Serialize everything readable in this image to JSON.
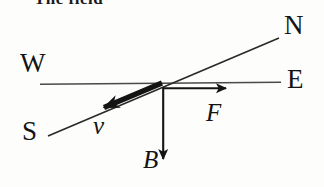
{
  "figure": {
    "kind": "physics-vector-diagram",
    "clipped_header_text": "The field",
    "background_color": "#fdfdfc",
    "ink_color": "#141414",
    "axis_line_color": "#4a4a48"
  },
  "compass": {
    "west_label": "W",
    "north_label": "N",
    "east_label": "E",
    "south_label": "S"
  },
  "vectors": {
    "velocity_label": "v",
    "force_label": "F",
    "field_label": "B"
  },
  "geometry": {
    "origin": {
      "x": 163,
      "y": 83
    },
    "we_axis": {
      "x1": 40,
      "y1": 84,
      "x2": 281,
      "y2": 82
    },
    "sn_axis": {
      "x1": 48,
      "y1": 136,
      "x2": 279,
      "y2": 38
    },
    "velocity_arrow": {
      "x1": 163,
      "y1": 83,
      "x2": 96,
      "y2": 111
    },
    "force_arrow": {
      "x1": 163,
      "y1": 88,
      "x2": 236,
      "y2": 88
    },
    "field_arrow": {
      "x1": 163,
      "y1": 88,
      "x2": 163,
      "y2": 170
    }
  }
}
